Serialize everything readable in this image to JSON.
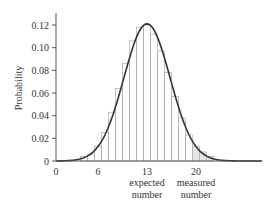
{
  "chart_data": {
    "type": "bar",
    "title": "",
    "xlabel": "",
    "ylabel": "Probability",
    "ylim": [
      0,
      0.13
    ],
    "xlim": [
      0,
      29
    ],
    "grid": false,
    "legend": null,
    "x_ticks": [
      "0",
      "6",
      "13",
      "20"
    ],
    "x_tick_values": [
      0,
      6,
      13,
      20
    ],
    "y_ticks": [
      "0",
      "0.02",
      "0.04",
      "0.06",
      "0.08",
      "0.10",
      "0.12"
    ],
    "y_tick_values": [
      0,
      0.02,
      0.04,
      0.06,
      0.08,
      0.1,
      0.12
    ],
    "annotations": [
      {
        "x": 13,
        "text": "expected number"
      },
      {
        "x": 20,
        "text": "measured number"
      }
    ],
    "categories": [
      4,
      5,
      6,
      7,
      8,
      9,
      10,
      11,
      12,
      13,
      14,
      15,
      16,
      17,
      18,
      19,
      20,
      21,
      22
    ],
    "values": [
      0.004,
      0.006,
      0.013,
      0.025,
      0.043,
      0.064,
      0.086,
      0.106,
      0.118,
      0.12,
      0.112,
      0.097,
      0.078,
      0.057,
      0.038,
      0.023,
      0.013,
      0.008,
      0.004
    ],
    "series": [
      {
        "name": "histogram",
        "type": "bar",
        "values": [
          0.004,
          0.006,
          0.013,
          0.025,
          0.043,
          0.064,
          0.086,
          0.106,
          0.118,
          0.12,
          0.112,
          0.097,
          0.078,
          0.057,
          0.038,
          0.023,
          0.013,
          0.008,
          0.004
        ]
      },
      {
        "name": "gaussian fit",
        "type": "line",
        "mean": 13,
        "sigma": 3.3,
        "peak": 0.121
      }
    ]
  },
  "axes": {
    "ylabel": "Probability",
    "annotation_expected_line1": "expected",
    "annotation_expected_line2": "number",
    "annotation_measured_line1": "measured",
    "annotation_measured_line2": "number"
  },
  "colors": {
    "axis": "#555555",
    "bar_stroke": "#aaaaaa",
    "curve": "#333333",
    "shade": "#cccccc"
  }
}
